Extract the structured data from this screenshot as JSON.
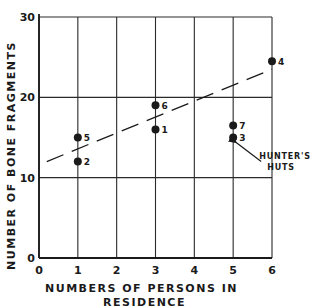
{
  "chart_data": {
    "type": "scatter",
    "title": "",
    "xlabel": "Numbers of Persons in Residence",
    "xlabel_lines": [
      "NUMBERS OF PERSONS IN",
      "RESIDENCE"
    ],
    "ylabel": "Number of Bone Fragments",
    "xlim": [
      0,
      6
    ],
    "ylim": [
      0,
      30
    ],
    "x_ticks": [
      "0",
      "1",
      "2",
      "3",
      "4",
      "5",
      "6"
    ],
    "y_ticks": [
      "0",
      "10",
      "20",
      "30"
    ],
    "grid": true,
    "legend": null,
    "points": [
      {
        "label": "1",
        "x": 3,
        "y": 16
      },
      {
        "label": "2",
        "x": 1,
        "y": 12
      },
      {
        "label": "3",
        "x": 5,
        "y": 15
      },
      {
        "label": "4",
        "x": 6,
        "y": 24.5
      },
      {
        "label": "5",
        "x": 1,
        "y": 15
      },
      {
        "label": "6",
        "x": 3,
        "y": 19
      },
      {
        "label": "7",
        "x": 5,
        "y": 16.5
      }
    ],
    "trend_line": {
      "style": "dashed",
      "x": [
        0.2,
        6
      ],
      "y": [
        12,
        23.5
      ]
    },
    "annotations": [
      {
        "text": "Hunter's Huts",
        "lines": [
          "HUNTER'S",
          "HUTS"
        ],
        "points_to": [
          "3",
          "7"
        ]
      }
    ]
  },
  "colors": {
    "ink": "#1a1a1a",
    "grid": "#2a2a2a",
    "background": "#ffffff"
  }
}
